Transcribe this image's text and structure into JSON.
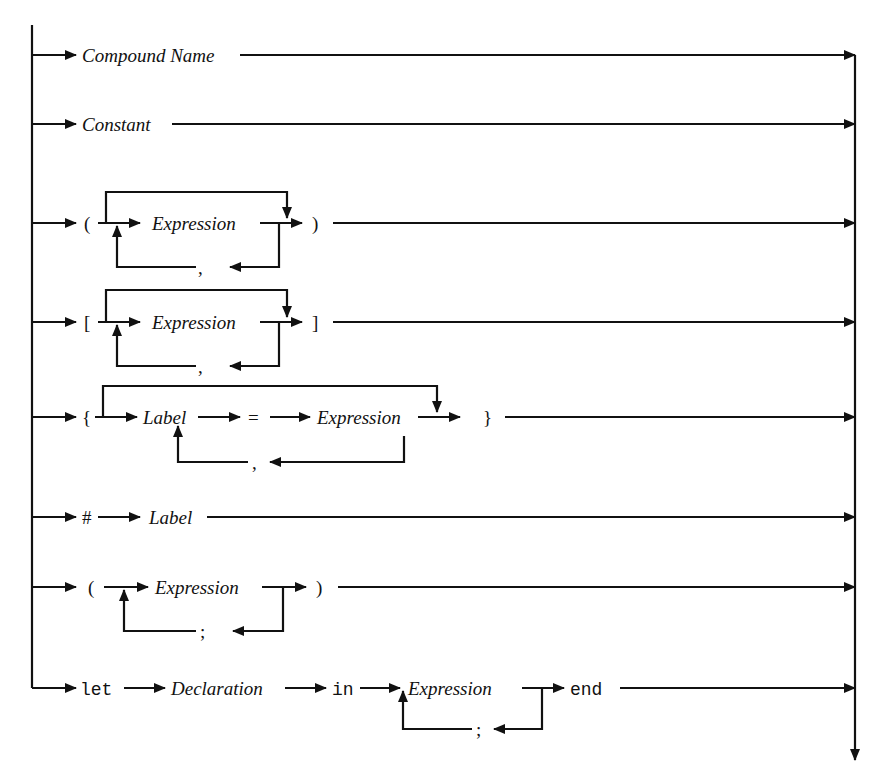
{
  "diagram": {
    "type": "syntax-railroad",
    "rows": [
      {
        "id": "compound-name",
        "items": [
          {
            "kind": "nonterminal",
            "text": "Compound Name"
          }
        ]
      },
      {
        "id": "constant",
        "items": [
          {
            "kind": "nonterminal",
            "text": "Constant"
          }
        ]
      },
      {
        "id": "tuple",
        "items": [
          {
            "kind": "terminal",
            "text": "("
          },
          {
            "kind": "nonterminal",
            "text": "Expression",
            "repeat_sep": ",",
            "optional": true
          },
          {
            "kind": "terminal",
            "text": ")"
          }
        ]
      },
      {
        "id": "list",
        "items": [
          {
            "kind": "terminal",
            "text": "["
          },
          {
            "kind": "nonterminal",
            "text": "Expression",
            "repeat_sep": ",",
            "optional": true
          },
          {
            "kind": "terminal",
            "text": "]"
          }
        ]
      },
      {
        "id": "record",
        "items": [
          {
            "kind": "terminal",
            "text": "{"
          },
          {
            "kind": "nonterminal",
            "text": "Label"
          },
          {
            "kind": "terminal",
            "text": "="
          },
          {
            "kind": "nonterminal",
            "text": "Expression",
            "repeat_sep": ",",
            "optional": true
          },
          {
            "kind": "terminal",
            "text": "}"
          }
        ]
      },
      {
        "id": "selector",
        "items": [
          {
            "kind": "terminal",
            "text": "#"
          },
          {
            "kind": "nonterminal",
            "text": "Label"
          }
        ]
      },
      {
        "id": "sequence",
        "items": [
          {
            "kind": "terminal",
            "text": "("
          },
          {
            "kind": "nonterminal",
            "text": "Expression",
            "repeat_sep": ";"
          },
          {
            "kind": "terminal",
            "text": ")"
          }
        ]
      },
      {
        "id": "let",
        "items": [
          {
            "kind": "keyword",
            "text": "let"
          },
          {
            "kind": "nonterminal",
            "text": "Declaration"
          },
          {
            "kind": "keyword",
            "text": "in"
          },
          {
            "kind": "nonterminal",
            "text": "Expression",
            "repeat_sep": ";"
          },
          {
            "kind": "keyword",
            "text": "end"
          }
        ]
      }
    ],
    "labels": {
      "compound_name": "Compound Name",
      "constant": "Constant",
      "expression": "Expression",
      "label": "Label",
      "declaration": "Declaration",
      "lparen": "(",
      "rparen": ")",
      "lbracket": "[",
      "rbracket": "]",
      "lbrace": "{",
      "rbrace": "}",
      "equals": "=",
      "hash": "#",
      "comma": ",",
      "semicolon": ";",
      "kw_let": "let",
      "kw_in": "in",
      "kw_end": "end"
    },
    "colors": {
      "ink": "#111111",
      "background": "#ffffff"
    }
  }
}
